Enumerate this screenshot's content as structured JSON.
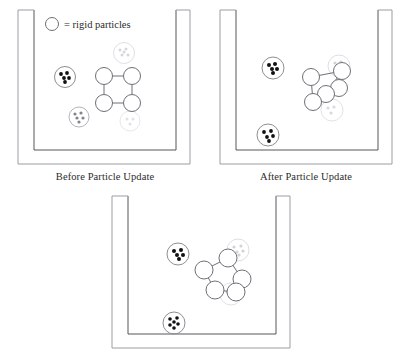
{
  "figure": {
    "background": "#ffffff",
    "stroke_dark": "#55565a",
    "stroke_mid": "#8d8f94",
    "stroke_ghost": "#d9dade",
    "dot_fill": "#111111",
    "dot_fill_light": "#6e7075"
  },
  "legend": {
    "symbol": "circle-outline-icon",
    "label": "= rigid particles"
  },
  "panels": [
    {
      "id": "before",
      "caption": "Before Particle Update",
      "container": "beaker-outline",
      "rigid_body": {
        "shape": "square",
        "node_count": 4,
        "nodes": [
          {
            "cx": 100,
            "cy": 72,
            "r": 8.5
          },
          {
            "cx": 128,
            "cy": 72,
            "r": 8.5
          },
          {
            "cx": 100,
            "cy": 99,
            "r": 8.5
          },
          {
            "cx": 128,
            "cy": 99,
            "r": 8.5
          }
        ],
        "edges": [
          [
            0,
            1
          ],
          [
            1,
            3
          ],
          [
            3,
            2
          ],
          [
            2,
            0
          ]
        ]
      },
      "particle_clusters": [
        {
          "cx": 61,
          "cy": 73,
          "r": 10.5,
          "tone": "dark",
          "dots": 5
        },
        {
          "cx": 75,
          "cy": 113,
          "r": 10.0,
          "tone": "light",
          "dots": 5
        },
        {
          "cx": 120,
          "cy": 49,
          "r": 10.5,
          "tone": "ghost",
          "dots": 5
        },
        {
          "cx": 126,
          "cy": 117,
          "r": 10.0,
          "tone": "ghost",
          "dots": 4
        }
      ]
    },
    {
      "id": "after",
      "caption": "After Particle Update",
      "container": "beaker-outline",
      "rigid_body": {
        "shape": "deformed-quadrilateral",
        "node_count": 5,
        "nodes": [
          {
            "cx": 101,
            "cy": 73,
            "r": 8.5
          },
          {
            "cx": 132,
            "cy": 67,
            "r": 8.5
          },
          {
            "cx": 129,
            "cy": 84,
            "r": 8.5
          },
          {
            "cx": 116,
            "cy": 90,
            "r": 8.5
          },
          {
            "cx": 103,
            "cy": 98,
            "r": 8.5
          }
        ],
        "edges": [
          [
            0,
            1
          ],
          [
            1,
            2
          ],
          [
            2,
            4
          ],
          [
            4,
            0
          ],
          [
            3,
            1
          ],
          [
            3,
            4
          ]
        ]
      },
      "particle_clusters": [
        {
          "cx": 63,
          "cy": 64,
          "r": 11.0,
          "tone": "dark",
          "dots": 5
        },
        {
          "cx": 58,
          "cy": 131,
          "r": 11.0,
          "tone": "dark",
          "dots": 5
        },
        {
          "cx": 129,
          "cy": 62,
          "r": 11.0,
          "tone": "ghost",
          "dots": 5
        },
        {
          "cx": 122,
          "cy": 106,
          "r": 11.0,
          "tone": "ghost",
          "dots": 4
        }
      ]
    },
    {
      "id": "final",
      "caption": "",
      "container": "beaker-outline",
      "rigid_body": {
        "shape": "pentagon",
        "node_count": 5,
        "nodes": [
          {
            "cx": 124,
            "cy": 66,
            "r": 9.0
          },
          {
            "cx": 100,
            "cy": 78,
            "r": 9.0
          },
          {
            "cx": 138,
            "cy": 87,
            "r": 9.0
          },
          {
            "cx": 111,
            "cy": 98,
            "r": 9.0
          },
          {
            "cx": 132,
            "cy": 100,
            "r": 9.0
          }
        ],
        "edges": [
          [
            1,
            0
          ],
          [
            0,
            2
          ],
          [
            2,
            4
          ],
          [
            4,
            3
          ],
          [
            3,
            1
          ]
        ]
      },
      "particle_clusters": [
        {
          "cx": 74,
          "cy": 62,
          "r": 11.0,
          "tone": "dark",
          "dots": 5
        },
        {
          "cx": 70,
          "cy": 131,
          "r": 11.0,
          "tone": "dark",
          "dots": 6
        },
        {
          "cx": 134,
          "cy": 58,
          "r": 11.0,
          "tone": "ghost",
          "dots": 5
        },
        {
          "cx": 127,
          "cy": 102,
          "r": 11.0,
          "tone": "ghost",
          "dots": 4
        }
      ]
    }
  ]
}
